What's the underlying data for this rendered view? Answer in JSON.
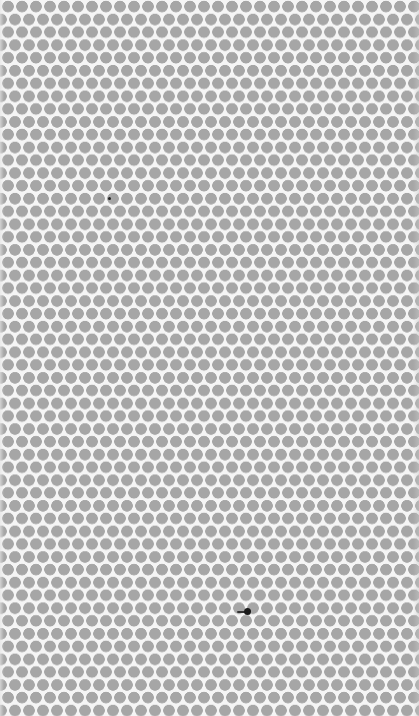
{
  "image": {
    "description": "Uniform hexagonal grid of grey dots on a light background",
    "pattern": {
      "dot_color": "#a6a6a6",
      "background_color": "#f5f5f5",
      "dot_diameter_px": 11,
      "horizontal_spacing_px": 14,
      "row_spacing_px": 12.8
    },
    "marks": [
      {
        "name": "small-speck",
        "color": "#222222"
      },
      {
        "name": "dark-blot",
        "color": "#1a1a1a"
      }
    ]
  }
}
